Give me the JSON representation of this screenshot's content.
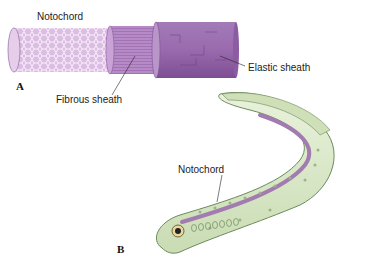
{
  "figure": {
    "panel_a": {
      "letter": "A",
      "labels": {
        "notochord": "Notochord",
        "fibrous_sheath": "Fibrous sheath",
        "elastic_sheath": "Elastic sheath"
      }
    },
    "panel_b": {
      "letter": "B",
      "labels": {
        "notochord": "Notochord"
      }
    },
    "colors": {
      "notochord_core": "#d9b8e0",
      "fibrous_sheath": "#b58bc4",
      "elastic_sheath": "#9e6fb0",
      "body_green": "#dcebc8",
      "body_outline": "#6b8a5a",
      "notochord_stripe": "#a27bb0"
    }
  }
}
